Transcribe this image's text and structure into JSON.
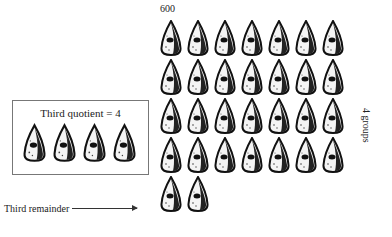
{
  "diagram": {
    "total_label": "600",
    "grid": {
      "rows": 4,
      "cols": 7,
      "item_icon": "arrowhead-icon"
    },
    "remainder_items": 2,
    "quotient_box": {
      "title": "Third quotient = 4",
      "items": 4
    },
    "remainder_label": "Third remainder",
    "groups_label": "4 groups"
  }
}
